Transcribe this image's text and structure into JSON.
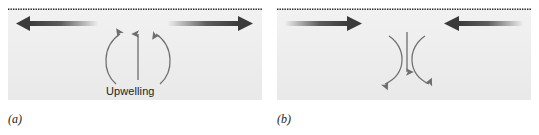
{
  "figure": {
    "background_color": "#ffffff",
    "water_fill_color": "#eeeeee",
    "arrow_dark_color": "#3b3b3b",
    "curve_color": "#6e6e6e",
    "surface_line_color": "#2b2b2b"
  },
  "panels": [
    {
      "caption": "(a)",
      "flow_label": "Upwelling",
      "surface_line": "dotted-surface-line",
      "surface_arrows": [
        {
          "name": "surface-arrow-left",
          "direction": "left",
          "description": "Thick gradient arrow pointing left, dark at head fading toward tail"
        },
        {
          "name": "surface-arrow-right",
          "direction": "right",
          "description": "Thick gradient arrow pointing right, dark at head fading toward tail"
        }
      ],
      "vertical_arrow": {
        "name": "upwelling-arrow",
        "direction": "up"
      },
      "curved_arrows": [
        {
          "name": "circulation-curve-left",
          "direction": "counterclockwise-up-left"
        },
        {
          "name": "circulation-curve-right",
          "direction": "clockwise-up-right"
        }
      ]
    },
    {
      "caption": "(b)",
      "flow_label": "Downwelling",
      "surface_line": "dotted-surface-line",
      "surface_arrows": [
        {
          "name": "surface-arrow-left",
          "direction": "right",
          "description": "Thick gradient arrow pointing right (inward), dark at head fading toward tail"
        },
        {
          "name": "surface-arrow-right",
          "direction": "left",
          "description": "Thick gradient arrow pointing left (inward), dark at head fading toward tail"
        }
      ],
      "vertical_arrow": {
        "name": "downwelling-arrow",
        "direction": "down"
      },
      "curved_arrows": [
        {
          "name": "circulation-curve-left",
          "direction": "clockwise-down-left"
        },
        {
          "name": "circulation-curve-right",
          "direction": "counterclockwise-down-right"
        }
      ]
    }
  ]
}
